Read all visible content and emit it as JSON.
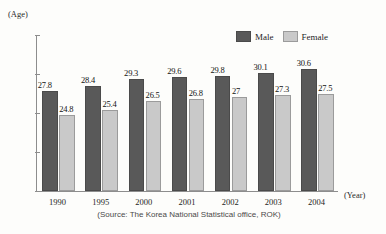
{
  "axis_units": {
    "y_unit_label": "(Age)",
    "x_unit_label": "(Year)"
  },
  "legend": {
    "entries": [
      {
        "label": "Male",
        "color": "#595959"
      },
      {
        "label": "Female",
        "color": "#c9c9c9"
      }
    ]
  },
  "source_note": "(Source: The Korea National Statistical office, ROK)",
  "chart_data": {
    "type": "bar",
    "title": "",
    "subtitle": "",
    "xlabel": "(Year)",
    "ylabel": "(Age)",
    "categories": [
      "1990",
      "1995",
      "2000",
      "2001",
      "2002",
      "2003",
      "2004"
    ],
    "series": [
      {
        "name": "Male",
        "color": "#595959",
        "values": [
          27.8,
          28.4,
          29.3,
          29.6,
          29.8,
          30.1,
          30.6
        ],
        "labels": [
          "27.8",
          "28.4",
          "29.3",
          "29.6",
          "29.8",
          "30.1",
          "30.6"
        ]
      },
      {
        "name": "Female",
        "color": "#c9c9c9",
        "values": [
          24.8,
          25.4,
          26.5,
          26.8,
          27,
          27.3,
          27.5
        ],
        "labels": [
          "24.8",
          "25.4",
          "26.5",
          "26.8",
          "27",
          "27.3",
          "27.5"
        ]
      }
    ],
    "ylim": [
      15,
      35
    ],
    "ytick_values": [
      35,
      30,
      25,
      20,
      15
    ],
    "ytick_labels": [
      "35",
      "30",
      "25",
      "30",
      "15"
    ],
    "grid": false,
    "legend_position": "top-right",
    "annotations": [
      "(Source: The Korea National Statistical office, ROK)"
    ]
  }
}
